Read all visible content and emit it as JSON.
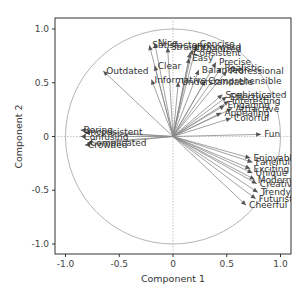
{
  "chart_data": {
    "type": "scatter",
    "subtype": "pca-loading-biplot",
    "title": "",
    "xlabel": "Component 1",
    "ylabel": "Component 2",
    "xlim": [
      -1.1,
      1.1
    ],
    "ylim": [
      -1.1,
      1.1
    ],
    "xticks": [
      "-1.0",
      "-0.5",
      "0",
      "0.5",
      "1.0"
    ],
    "yticks": [
      "1.0",
      "0.5",
      "0",
      "-0.5",
      "-1.0"
    ],
    "grid": false,
    "unit_circle": true,
    "reference_lines": {
      "x0": true,
      "y0": true
    },
    "legend": "none",
    "colors": {
      "arrow": "#8a8a8a",
      "arrowhead": "#555555",
      "circle": "#b0b0b0",
      "frame": "#333333",
      "label": "#333333"
    },
    "vectors": [
      {
        "label": "Nice",
        "x": -0.17,
        "y": 0.87
      },
      {
        "label": "Satisfactory",
        "x": -0.22,
        "y": 0.85
      },
      {
        "label": "Straightforward",
        "x": -0.05,
        "y": 0.83
      },
      {
        "label": "Concise",
        "x": 0.22,
        "y": 0.86
      },
      {
        "label": "Organized",
        "x": 0.18,
        "y": 0.81
      },
      {
        "label": "Consistent",
        "x": 0.16,
        "y": 0.78
      },
      {
        "label": "Easy",
        "x": 0.15,
        "y": 0.73
      },
      {
        "label": "Clear",
        "x": -0.17,
        "y": 0.66
      },
      {
        "label": "Precise",
        "x": 0.4,
        "y": 0.69
      },
      {
        "label": "Realistic",
        "x": 0.45,
        "y": 0.64
      },
      {
        "label": "Balanced",
        "x": 0.24,
        "y": 0.62
      },
      {
        "label": "Professional",
        "x": 0.5,
        "y": 0.61
      },
      {
        "label": "Outdated",
        "x": -0.65,
        "y": 0.61
      },
      {
        "label": "Informative",
        "x": -0.2,
        "y": 0.53
      },
      {
        "label": "Understandable",
        "x": 0.05,
        "y": 0.51
      },
      {
        "label": "Comprehensible",
        "x": 0.3,
        "y": 0.52
      },
      {
        "label": "Sophisticated",
        "x": 0.46,
        "y": 0.39
      },
      {
        "label": "Effective",
        "x": 0.5,
        "y": 0.37
      },
      {
        "label": "Interesting",
        "x": 0.52,
        "y": 0.33
      },
      {
        "label": "Engaging",
        "x": 0.48,
        "y": 0.29
      },
      {
        "label": "Attractive",
        "x": 0.55,
        "y": 0.26
      },
      {
        "label": "Appealing",
        "x": 0.45,
        "y": 0.22
      },
      {
        "label": "Colorful",
        "x": 0.54,
        "y": 0.17
      },
      {
        "label": "Fun",
        "x": 0.82,
        "y": 0.02
      },
      {
        "label": "Boring",
        "x": -0.86,
        "y": 0.06
      },
      {
        "label": "Inconsistent",
        "x": -0.82,
        "y": 0.04
      },
      {
        "label": "Confusing",
        "x": -0.86,
        "y": 0.0
      },
      {
        "label": "Complicated",
        "x": -0.8,
        "y": -0.06
      },
      {
        "label": "Crowded",
        "x": -0.82,
        "y": -0.08
      },
      {
        "label": "Enjoyable",
        "x": 0.72,
        "y": -0.2
      },
      {
        "label": "Fanciful",
        "x": 0.74,
        "y": -0.24
      },
      {
        "label": "Exciting",
        "x": 0.72,
        "y": -0.3
      },
      {
        "label": "Unique",
        "x": 0.74,
        "y": -0.34
      },
      {
        "label": "Modern",
        "x": 0.76,
        "y": -0.4
      },
      {
        "label": "Creative",
        "x": 0.78,
        "y": -0.44
      },
      {
        "label": "Trendy",
        "x": 0.79,
        "y": -0.52
      },
      {
        "label": "Futuristic",
        "x": 0.77,
        "y": -0.58
      },
      {
        "label": "Cheerful",
        "x": 0.68,
        "y": -0.64
      }
    ]
  }
}
